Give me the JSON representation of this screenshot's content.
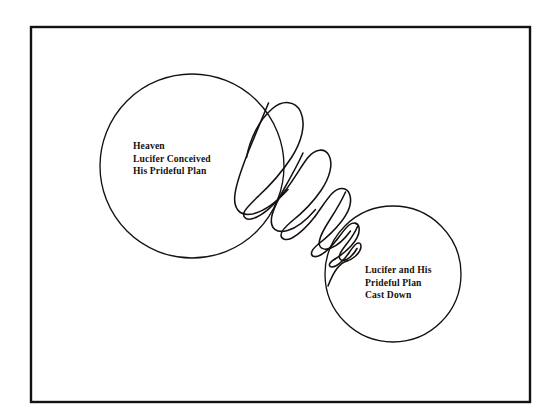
{
  "figure": {
    "name": "lucifer-prideful-plan-diagram",
    "background_color": "#ffffff",
    "ink_color": "#16110f",
    "frame": {
      "name": "outer-border-rectangle",
      "x": 31,
      "y": 27,
      "width": 499,
      "height": 375,
      "stroke_width": 2.4
    },
    "circles": [
      {
        "name": "heaven-circle",
        "cx": 192,
        "cy": 166,
        "r": 92,
        "stroke_width": 1.3
      },
      {
        "name": "cast-down-circle",
        "cx": 393,
        "cy": 274,
        "r": 68,
        "stroke_width": 1.3
      }
    ],
    "spiral": {
      "name": "descending-coil",
      "description": "hand-drawn diminishing helix descending diagonally from the heaven circle to the cast down circle",
      "loop_count": 5,
      "start": {
        "x": 247,
        "y": 155
      },
      "end": {
        "x": 356,
        "y": 252
      },
      "stroke_width": 1.5
    },
    "labels": [
      {
        "name": "heaven-label",
        "lines": [
          "Heaven",
          "Lucifer Conceived",
          "His Prideful Plan"
        ]
      },
      {
        "name": "cast-down-label",
        "lines": [
          "Lucifer and His",
          "Prideful Plan",
          "Cast Down"
        ]
      }
    ]
  }
}
